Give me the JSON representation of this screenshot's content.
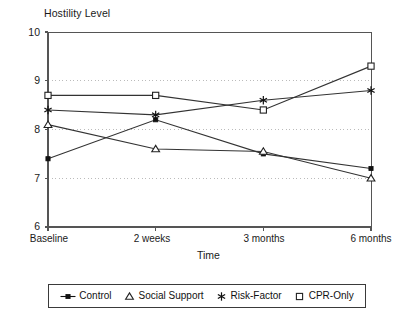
{
  "chart_data": {
    "type": "line",
    "title": "Hostility Level",
    "xlabel": "Time",
    "ylabel": "Hostility Level",
    "categories": [
      "Baseline",
      "2 weeks",
      "3 months",
      "6 months"
    ],
    "ylim": [
      6,
      10
    ],
    "yticks": [
      10,
      9,
      8,
      7,
      6
    ],
    "ytick_labels": [
      "10",
      "9",
      "8",
      "7",
      "6"
    ],
    "grid": "horizontal-dotted-at-7-8-9",
    "legend_position": "below-plot",
    "series": [
      {
        "name": "Control",
        "marker": "filled-square",
        "values": [
          7.4,
          8.2,
          7.5,
          7.2
        ]
      },
      {
        "name": "Social Support",
        "marker": "open-triangle",
        "values": [
          8.1,
          7.6,
          7.55,
          7.0
        ]
      },
      {
        "name": "Risk-Factor",
        "marker": "asterisk",
        "values": [
          8.4,
          8.3,
          8.6,
          8.8
        ]
      },
      {
        "name": "CPR-Only",
        "marker": "open-square",
        "values": [
          8.7,
          8.7,
          8.4,
          9.3
        ]
      }
    ]
  },
  "axis": {
    "ytick_0": "10",
    "ytick_1": "9",
    "ytick_2": "8",
    "ytick_3": "7",
    "ytick_4": "6",
    "xtick_0": "Baseline",
    "xtick_1": "2 weeks",
    "xtick_2": "3 months",
    "xtick_3": "6 months",
    "xlabel": "Time"
  },
  "title": {
    "text": "Hostility Level"
  },
  "legend": {
    "items": [
      {
        "label": "Control",
        "marker": "filled-square"
      },
      {
        "label": "Social Support",
        "marker": "open-triangle"
      },
      {
        "label": "Risk-Factor",
        "marker": "asterisk"
      },
      {
        "label": "CPR-Only",
        "marker": "open-square"
      }
    ]
  },
  "colors": {
    "line": "#333333",
    "axis": "#555555",
    "grid": "#bbbbbb",
    "text": "#1a1a1a",
    "background": "#ffffff"
  }
}
